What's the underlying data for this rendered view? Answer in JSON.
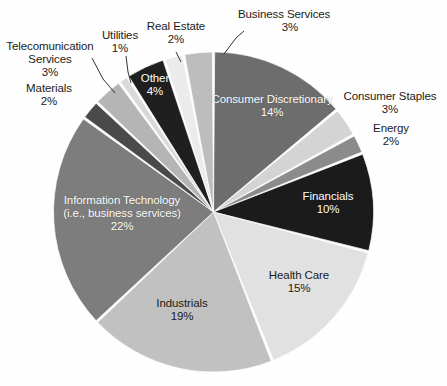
{
  "chart_data": {
    "type": "pie",
    "title": "",
    "subtitle": "",
    "xlabel": "",
    "ylabel": "",
    "legend_position": "none",
    "grid": false,
    "total_percent": 100,
    "value_unit": "%",
    "start_angle_deg": 0,
    "direction": "clockwise",
    "categories": [
      "Consumer Discretionary",
      "Consumer Staples",
      "Energy",
      "Financials",
      "Health Care",
      "Industrials",
      "Information Technology (i.e., business services)",
      "Materials",
      "Telecomunication Services",
      "Utilities",
      "Other",
      "Real Estate",
      "Business Services"
    ],
    "values": [
      14,
      3,
      2,
      10,
      15,
      19,
      22,
      2,
      3,
      1,
      4,
      2,
      3
    ],
    "slices": [
      {
        "label": "Consumer Discretionary",
        "value": 14,
        "pct_text": "14%",
        "color": "#6d6d6d",
        "label_placement": "inside",
        "label_color": "#ffffff"
      },
      {
        "label": "Consumer Staples",
        "value": 3,
        "pct_text": "3%",
        "color": "#d4d4d4",
        "label_placement": "outside",
        "label_color": "#1b1b1b"
      },
      {
        "label": "Energy",
        "value": 2,
        "pct_text": "2%",
        "color": "#8b8b8b",
        "label_placement": "outside",
        "label_color": "#1b1b1b"
      },
      {
        "label": "Financials",
        "value": 10,
        "pct_text": "10%",
        "color": "#1b1b1b",
        "label_placement": "inside",
        "label_color": "#ffffff"
      },
      {
        "label": "Health Care",
        "value": 15,
        "pct_text": "15%",
        "color": "#e1e1e1",
        "label_placement": "inside",
        "label_color": "#1b1b1b"
      },
      {
        "label": "Industrials",
        "value": 19,
        "pct_text": "19%",
        "color": "#c1c1c1",
        "label_placement": "inside",
        "label_color": "#1b1b1b"
      },
      {
        "label": "Information Technology (i.e., business services)",
        "value": 22,
        "pct_text": "22%",
        "color": "#7d7d7d",
        "label_placement": "inside",
        "label_color": "#ffffff"
      },
      {
        "label": "Materials",
        "value": 2,
        "pct_text": "2%",
        "color": "#4a4a4a",
        "label_placement": "outside",
        "label_color": "#1b1b1b"
      },
      {
        "label": "Telecomunication Services",
        "value": 3,
        "pct_text": "3%",
        "color": "#b5b5b5",
        "label_placement": "outside",
        "label_color": "#1b1b1b"
      },
      {
        "label": "Utilities",
        "value": 1,
        "pct_text": "1%",
        "color": "#d9d9d9",
        "label_placement": "outside",
        "label_color": "#1b1b1b"
      },
      {
        "label": "Other",
        "value": 4,
        "pct_text": "4%",
        "color": "#1f1f1f",
        "label_placement": "inside",
        "label_color": "#ffffff"
      },
      {
        "label": "Real Estate",
        "value": 2,
        "pct_text": "2%",
        "color": "#ebebeb",
        "label_placement": "outside",
        "label_color": "#1b1b1b"
      },
      {
        "label": "Business Services",
        "value": 3,
        "pct_text": "3%",
        "color": "#bdbdbd",
        "label_placement": "outside",
        "label_color": "#1b1b1b"
      }
    ]
  },
  "labels": {
    "consumer_discretionary": {
      "name": "Consumer Discretionary",
      "pct": "14%"
    },
    "consumer_staples": {
      "name": "Consumer Staples",
      "pct": "3%"
    },
    "energy": {
      "name": "Energy",
      "pct": "2%"
    },
    "financials": {
      "name": "Financials",
      "pct": "10%"
    },
    "health_care": {
      "name": "Health Care",
      "pct": "15%"
    },
    "industrials": {
      "name": "Industrials",
      "pct": "19%"
    },
    "information_technology": {
      "name_line1": "Information Technology",
      "name_line2": "(i.e., business services)",
      "pct": "22%"
    },
    "materials": {
      "name": "Materials",
      "pct": "2%"
    },
    "telecom_services": {
      "name_line1": "Telecomunication",
      "name_line2": "Services",
      "pct": "3%"
    },
    "utilities": {
      "name": "Utilities",
      "pct": "1%"
    },
    "other": {
      "name": "Other",
      "pct": "4%"
    },
    "real_estate": {
      "name": "Real Estate",
      "pct": "2%"
    },
    "business_services": {
      "name": "Business Services",
      "pct": "3%"
    }
  }
}
